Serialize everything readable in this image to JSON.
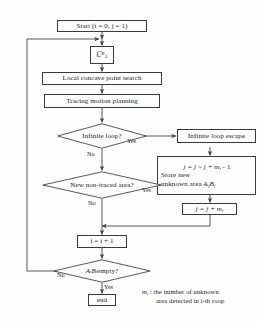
{
  "diagram": {
    "type": "flowchart",
    "stroke_color": "#3a3a3a",
    "background": "#fdfdfd",
    "nodes": {
      "start": {
        "label": "Start (i = 0, j = 1)",
        "shape": "rect"
      },
      "symbol": {
        "label": "C",
        "sub": "A",
        "sup": "B",
        "shape": "rect"
      },
      "local_search": {
        "label": "Local concave point search",
        "shape": "rect"
      },
      "tracing": {
        "label": "Tracing motion planning",
        "shape": "rect"
      },
      "infinite_loop_q": {
        "label": "Infinite loop?",
        "shape": "diamond"
      },
      "infinite_loop_escape": {
        "label": "Infinite loop escape",
        "shape": "rect"
      },
      "store_area": {
        "line1": "j = j ~ j + m",
        "line1_sub": "i",
        "line1_tail": " - 1",
        "line2": "Store new",
        "line3": "unknown area A",
        "line3_sub": "j",
        "line3_mid": "B",
        "line3_sub2": "j",
        "shape": "rect"
      },
      "new_untraced_q": {
        "label": "New non-traced area?",
        "shape": "diamond"
      },
      "increment_j": {
        "label": "j = j + m",
        "sub": "i",
        "shape": "rect"
      },
      "increment_i": {
        "label": "i = i + 1",
        "shape": "rect"
      },
      "empty_q": {
        "label": "A",
        "sub1": "i",
        "mid": "B",
        "sub2": "i",
        "tail": " empty?",
        "shape": "diamond"
      },
      "end": {
        "label": "end",
        "shape": "rect"
      }
    },
    "edge_labels": {
      "infinite_loop_yes": "Yes",
      "infinite_loop_no": "No",
      "new_untraced_yes": "Yes",
      "new_untraced_no": "No",
      "empty_yes": "Yes",
      "empty_no": "No"
    },
    "legend": {
      "symbol": "m",
      "symbol_sub": "i",
      "line1": " : the number of unknown",
      "line2": "area detected in i-th roop"
    }
  }
}
